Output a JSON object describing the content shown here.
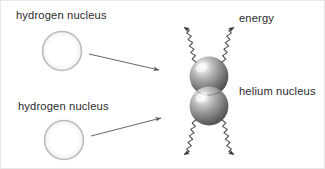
{
  "figure": {
    "width": 325,
    "height": 169,
    "background": "#ffffff"
  },
  "labels": {
    "hydrogen_top": "hydrogen nucleus",
    "hydrogen_bottom": "hydrogen nucleus",
    "energy": "energy",
    "helium": "helium nucleus"
  },
  "colors": {
    "text": "#2b2b2b",
    "stroke": "#555555",
    "circle_outline": "#b8b8b8",
    "circle_fill": "#ffffff",
    "sphere_light": "#f2f2f2",
    "sphere_mid": "#9a9a9a",
    "sphere_dark": "#4a4a4a",
    "canvas_border": "#e8e8e8"
  },
  "shapes": {
    "hydrogen_nuclei": [
      {
        "name": "hydrogen-nucleus-top",
        "cx": 61,
        "cy": 50,
        "r": 19
      },
      {
        "name": "hydrogen-nucleus-bottom",
        "cx": 63,
        "cy": 139,
        "r": 19
      }
    ],
    "helium_spheres": [
      {
        "name": "helium-sphere-upper",
        "cx": 208,
        "cy": 75,
        "r": 19
      },
      {
        "name": "helium-sphere-lower",
        "cx": 208,
        "cy": 105,
        "r": 19
      }
    ],
    "straight_arrows": [
      {
        "name": "fusion-arrow-top",
        "x1": 88,
        "y1": 53,
        "x2": 160,
        "y2": 69
      },
      {
        "name": "fusion-arrow-bottom",
        "x1": 90,
        "y1": 135,
        "x2": 162,
        "y2": 117
      }
    ],
    "energy_waves": [
      {
        "name": "energy-wave-upper-left",
        "x1": 194,
        "y1": 62,
        "x2": 160,
        "y2": 27
      },
      {
        "name": "energy-wave-upper-right",
        "x1": 222,
        "y1": 62,
        "x2": 256,
        "y2": 27
      },
      {
        "name": "energy-wave-lower-left",
        "x1": 194,
        "y1": 118,
        "x2": 160,
        "y2": 152
      },
      {
        "name": "energy-wave-lower-right",
        "x1": 222,
        "y1": 118,
        "x2": 256,
        "y2": 152
      }
    ]
  }
}
